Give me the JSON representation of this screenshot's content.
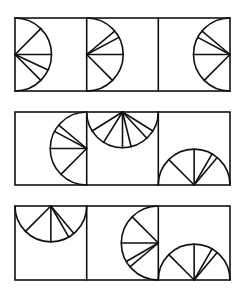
{
  "title": "",
  "colors": {
    "stroke": "#111111",
    "background": "#ffffff"
  },
  "layout": {
    "columns_x": [
      15,
      86.7,
      158.3,
      230
    ],
    "rows": [
      {
        "top": 18,
        "bottom": 91
      },
      {
        "top": 112,
        "bottom": 185
      },
      {
        "top": 206,
        "bottom": 280
      }
    ]
  },
  "rows": [
    {
      "name": "row-1",
      "cells": [
        {
          "semicircle_edge": "left",
          "ray_angles_deg": [
            -45,
            0,
            25,
            45
          ]
        },
        {
          "semicircle_edge": "left",
          "ray_angles_deg": [
            -40,
            -28,
            0,
            45
          ]
        },
        {
          "semicircle_edge": "right",
          "ray_angles_deg": [
            -140,
            -152,
            180,
            135
          ]
        }
      ]
    },
    {
      "name": "row-2",
      "cells": [
        {
          "semicircle_edge": "right",
          "ray_angles_deg": [
            -140,
            -152,
            180,
            135
          ]
        },
        {
          "semicircle_edge": "top",
          "ray_angles_deg": [
            148,
            122,
            90,
            76,
            47,
            32
          ]
        },
        {
          "semicircle_edge": "bottom",
          "ray_angles_deg": [
            -135,
            -90,
            -60,
            -50
          ]
        }
      ]
    },
    {
      "name": "row-3",
      "cells": [
        {
          "semicircle_edge": "top",
          "ray_angles_deg": [
            135,
            90,
            60,
            50
          ]
        },
        {
          "semicircle_edge": "right",
          "ray_angles_deg": [
            -135,
            180,
            150,
            140
          ]
        },
        {
          "semicircle_edge": "bottom",
          "ray_angles_deg": [
            -135,
            -90,
            -60,
            -50
          ]
        }
      ]
    }
  ]
}
